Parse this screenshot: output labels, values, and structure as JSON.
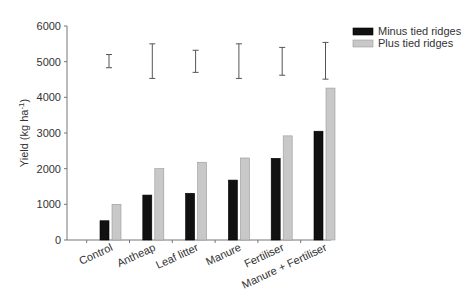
{
  "chart_data": {
    "type": "bar",
    "title": "",
    "xlabel": "",
    "ylabel": "Yield (kg ha",
    "ylabel_superscript": "-1",
    "ylabel_close": ")",
    "ylim": [
      0,
      6000
    ],
    "yticks": [
      0,
      1000,
      2000,
      3000,
      4000,
      5000,
      6000
    ],
    "grid": false,
    "legend_position": "top-right",
    "categories": [
      "Control",
      "Antheap",
      "Leaf litter",
      "Manure",
      "Fertiliser",
      "Manure + Fertiliser"
    ],
    "series": [
      {
        "name": "Minus tied ridges",
        "color": "#111111",
        "values": [
          540,
          1260,
          1310,
          1680,
          2290,
          3050
        ]
      },
      {
        "name": "Plus tied ridges",
        "color": "#c8c8c8",
        "values": [
          1000,
          2000,
          2180,
          2300,
          2920,
          4260
        ]
      }
    ],
    "error_bars": [
      {
        "category": "Control",
        "low": 4830,
        "high": 5200
      },
      {
        "category": "Antheap",
        "low": 4530,
        "high": 5500
      },
      {
        "category": "Leaf litter",
        "low": 4700,
        "high": 5320
      },
      {
        "category": "Manure",
        "low": 4530,
        "high": 5500
      },
      {
        "category": "Fertiliser",
        "low": 4620,
        "high": 5400
      },
      {
        "category": "Manure + Fertiliser",
        "low": 4510,
        "high": 5540
      }
    ]
  }
}
